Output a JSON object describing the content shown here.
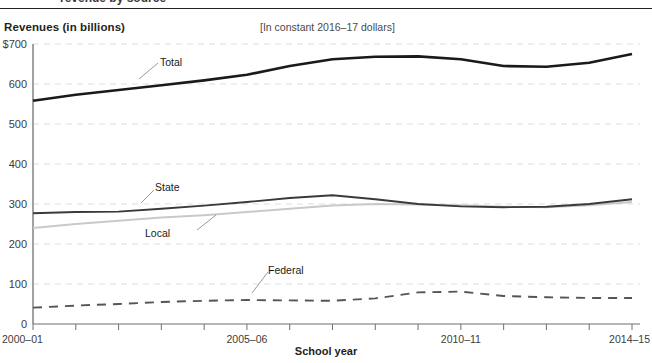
{
  "header": {
    "cut_heading": "revenue by source",
    "y_axis_title": "Revenues (in billions)",
    "units_note": "[In constant 2016–17 dollars]"
  },
  "axes": {
    "x_title": "School year",
    "y_tick_labels": [
      "$700",
      "600",
      "500",
      "400",
      "300",
      "200",
      "100",
      "0"
    ],
    "x_tick_labels_shown": [
      "2000–01",
      "2005–06",
      "2010–11",
      "2014–15"
    ]
  },
  "series_labels": {
    "total": "Total",
    "state": "State",
    "local": "Local",
    "federal": "Federal"
  },
  "colors": {
    "total": "#1a1a1a",
    "state": "#3a3a3a",
    "local": "#c9c9c9",
    "federal": "#555555",
    "grid": "#dddddd",
    "axis": "#8a8a8a",
    "text": "#231f20"
  },
  "chart_data": {
    "type": "line",
    "title": "Revenues (in billions)",
    "subtitle": "[In constant 2016–17 dollars]",
    "xlabel": "School year",
    "ylabel": "Revenues (in billions)",
    "ylim": [
      0,
      700
    ],
    "yticks": [
      0,
      100,
      200,
      300,
      400,
      500,
      600,
      700
    ],
    "grid": true,
    "legend": "inline-labels",
    "categories": [
      "2000–01",
      "2001–02",
      "2002–03",
      "2003–04",
      "2004–05",
      "2005–06",
      "2006–07",
      "2007–08",
      "2008–09",
      "2009–10",
      "2010–11",
      "2011–12",
      "2012–13",
      "2013–14",
      "2014–15"
    ],
    "series": [
      {
        "name": "Total",
        "style": "solid-thick",
        "values": [
          558,
          573,
          585,
          597,
          609,
          623,
          645,
          662,
          668,
          669,
          662,
          645,
          643,
          653,
          675
        ]
      },
      {
        "name": "State",
        "style": "solid",
        "values": [
          277,
          280,
          281,
          288,
          296,
          305,
          315,
          322,
          312,
          300,
          294,
          292,
          293,
          300,
          312
        ]
      },
      {
        "name": "Local",
        "style": "solid-light",
        "values": [
          240,
          250,
          258,
          266,
          272,
          280,
          288,
          296,
          300,
          299,
          297,
          293,
          292,
          297,
          305
        ]
      },
      {
        "name": "Federal",
        "style": "dashed",
        "values": [
          41,
          46,
          50,
          55,
          58,
          60,
          59,
          58,
          64,
          79,
          81,
          70,
          67,
          65,
          65
        ]
      }
    ]
  }
}
